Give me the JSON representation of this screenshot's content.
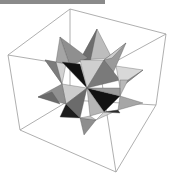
{
  "figure": {
    "top_bar_color": "#8a8a8a"
  },
  "box": {
    "edge_color": "#9a9a9a",
    "edges": [
      [
        [
          70,
          9
        ],
        [
          166,
          34
        ]
      ],
      [
        [
          70,
          9
        ],
        [
          8,
          55
        ]
      ],
      [
        [
          70,
          9
        ],
        [
          70,
          100
        ]
      ],
      [
        [
          166,
          34
        ],
        [
          156,
          105
        ]
      ],
      [
        [
          8,
          55
        ],
        [
          20,
          130
        ]
      ],
      [
        [
          8,
          55
        ],
        [
          100,
          70
        ]
      ],
      [
        [
          166,
          34
        ],
        [
          100,
          70
        ]
      ],
      [
        [
          100,
          70
        ],
        [
          116,
          172
        ]
      ],
      [
        [
          20,
          130
        ],
        [
          116,
          172
        ]
      ],
      [
        [
          156,
          105
        ],
        [
          116,
          172
        ]
      ],
      [
        [
          20,
          130
        ],
        [
          70,
          100
        ]
      ],
      [
        [
          156,
          105
        ],
        [
          70,
          100
        ]
      ]
    ]
  },
  "solid": {
    "faces": [
      {
        "pts": [
          [
            97,
            29
          ],
          [
            80,
            60
          ],
          [
            112,
            58
          ]
        ],
        "fill": "#bdbdbd"
      },
      {
        "pts": [
          [
            97,
            29
          ],
          [
            80,
            60
          ],
          [
            88,
            72
          ]
        ],
        "fill": "#6e6e6e"
      },
      {
        "pts": [
          [
            60,
            37
          ],
          [
            70,
            66
          ],
          [
            88,
            58
          ]
        ],
        "fill": "#8f8f8f"
      },
      {
        "pts": [
          [
            60,
            37
          ],
          [
            70,
            66
          ],
          [
            56,
            62
          ]
        ],
        "fill": "#a5a5a5"
      },
      {
        "pts": [
          [
            126,
            43
          ],
          [
            104,
            60
          ],
          [
            110,
            80
          ]
        ],
        "fill": "#9a9a9a"
      },
      {
        "pts": [
          [
            126,
            43
          ],
          [
            112,
            58
          ],
          [
            104,
            60
          ]
        ],
        "fill": "#cfcfcf"
      },
      {
        "pts": [
          [
            45,
            60
          ],
          [
            66,
            64
          ],
          [
            62,
            84
          ]
        ],
        "fill": "#d2d2d2"
      },
      {
        "pts": [
          [
            45,
            60
          ],
          [
            56,
            62
          ],
          [
            62,
            84
          ]
        ],
        "fill": "#7c7c7c"
      },
      {
        "pts": [
          [
            62,
            62
          ],
          [
            80,
            64
          ],
          [
            87,
            88
          ]
        ],
        "fill": "#111111"
      },
      {
        "pts": [
          [
            80,
            60
          ],
          [
            104,
            60
          ],
          [
            87,
            88
          ]
        ],
        "fill": "#cfcfcf"
      },
      {
        "pts": [
          [
            104,
            60
          ],
          [
            120,
            80
          ],
          [
            87,
            88
          ]
        ],
        "fill": "#7a7a7a"
      },
      {
        "pts": [
          [
            143,
            70
          ],
          [
            116,
            66
          ],
          [
            120,
            88
          ]
        ],
        "fill": "#d8d8d8"
      },
      {
        "pts": [
          [
            143,
            70
          ],
          [
            120,
            88
          ],
          [
            128,
            80
          ]
        ],
        "fill": "#8d8d8d"
      },
      {
        "pts": [
          [
            120,
            80
          ],
          [
            128,
            80
          ],
          [
            120,
            96
          ]
        ],
        "fill": "#b8b8b8"
      },
      {
        "pts": [
          [
            62,
            84
          ],
          [
            87,
            88
          ],
          [
            66,
            104
          ]
        ],
        "fill": "#cdcdcd"
      },
      {
        "pts": [
          [
            38,
            97
          ],
          [
            62,
            84
          ],
          [
            66,
            104
          ]
        ],
        "fill": "#909090"
      },
      {
        "pts": [
          [
            38,
            97
          ],
          [
            52,
            92
          ],
          [
            60,
            104
          ]
        ],
        "fill": "#6a6a6a"
      },
      {
        "pts": [
          [
            87,
            88
          ],
          [
            120,
            96
          ],
          [
            104,
            112
          ]
        ],
        "fill": "#121212"
      },
      {
        "pts": [
          [
            87,
            88
          ],
          [
            120,
            88
          ],
          [
            120,
            96
          ]
        ],
        "fill": "#9c9c9c"
      },
      {
        "pts": [
          [
            143,
            103
          ],
          [
            120,
            96
          ],
          [
            118,
            110
          ]
        ],
        "fill": "#a6a6a6"
      },
      {
        "pts": [
          [
            87,
            88
          ],
          [
            66,
            104
          ],
          [
            80,
            118
          ]
        ],
        "fill": "#6b6b6b"
      },
      {
        "pts": [
          [
            87,
            88
          ],
          [
            104,
            112
          ],
          [
            90,
            116
          ]
        ],
        "fill": "#b5b5b5"
      },
      {
        "pts": [
          [
            60,
            117
          ],
          [
            66,
            104
          ],
          [
            80,
            118
          ]
        ],
        "fill": "#1c1c1c"
      },
      {
        "pts": [
          [
            84,
            135
          ],
          [
            80,
            118
          ],
          [
            96,
            120
          ]
        ],
        "fill": "#8e8e8e"
      },
      {
        "pts": [
          [
            80,
            118
          ],
          [
            90,
            116
          ],
          [
            96,
            120
          ]
        ],
        "fill": "#c4c4c4"
      },
      {
        "pts": [
          [
            96,
            120
          ],
          [
            104,
            112
          ],
          [
            118,
            110
          ]
        ],
        "fill": "#d5d5d5"
      },
      {
        "pts": [
          [
            120,
            113
          ],
          [
            104,
            112
          ],
          [
            118,
            110
          ]
        ],
        "fill": "#2a2a2a"
      }
    ]
  }
}
